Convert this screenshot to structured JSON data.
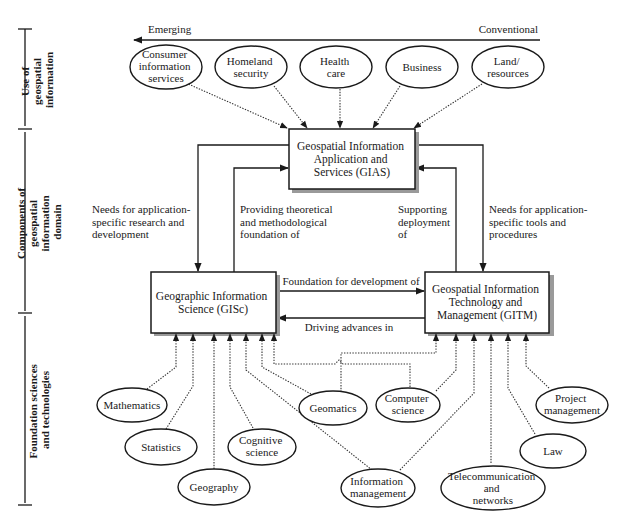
{
  "axis_arrow": {
    "left_label": "Emerging",
    "right_label": "Conventional"
  },
  "side_brackets": [
    {
      "lines": [
        "Use of",
        "geospatial",
        "information"
      ]
    },
    {
      "lines": [
        "Components of",
        "geospatial",
        "information",
        "domain"
      ]
    },
    {
      "lines": [
        "Foundation sciences",
        "and technologies"
      ]
    }
  ],
  "use_ovals": [
    {
      "lines": [
        "Consumer",
        "information",
        "services"
      ]
    },
    {
      "lines": [
        "Homeland",
        "security"
      ]
    },
    {
      "lines": [
        "Health",
        "care"
      ]
    },
    {
      "lines": [
        "Business"
      ]
    },
    {
      "lines": [
        "Land/",
        "resources"
      ]
    }
  ],
  "boxes": {
    "gias": {
      "lines": [
        "Geospatial Information",
        "Application and",
        "Services (GIAS)"
      ]
    },
    "gisc": {
      "lines": [
        "Geographic Information",
        "Science (GISc)"
      ]
    },
    "gitm": {
      "lines": [
        "Geospatial Information",
        "Technology and",
        "Management (GITM)"
      ]
    }
  },
  "edge_labels": {
    "gias_to_gisc": [
      "Needs for application-",
      "specific research and",
      "development"
    ],
    "gisc_to_gias": [
      "Providing theoretical",
      "and methodological",
      "foundation of"
    ],
    "gitm_to_gias": [
      "Supporting",
      "deployment",
      "of"
    ],
    "gias_to_gitm": [
      "Needs for application-",
      "specific tools and",
      "procedures"
    ],
    "gisc_to_gitm": "Foundation for development of",
    "gitm_to_gisc": "Driving advances in"
  },
  "foundation_ovals": [
    {
      "lines": [
        "Mathematics"
      ]
    },
    {
      "lines": [
        "Statistics"
      ]
    },
    {
      "lines": [
        "Geography"
      ]
    },
    {
      "lines": [
        "Cognitive",
        "science"
      ]
    },
    {
      "lines": [
        "Geomatics"
      ]
    },
    {
      "lines": [
        "Computer",
        "science"
      ]
    },
    {
      "lines": [
        "Information",
        "management"
      ]
    },
    {
      "lines": [
        "Telecommunication",
        "and",
        "networks"
      ]
    },
    {
      "lines": [
        "Law"
      ]
    },
    {
      "lines": [
        "Project",
        "management"
      ]
    }
  ]
}
